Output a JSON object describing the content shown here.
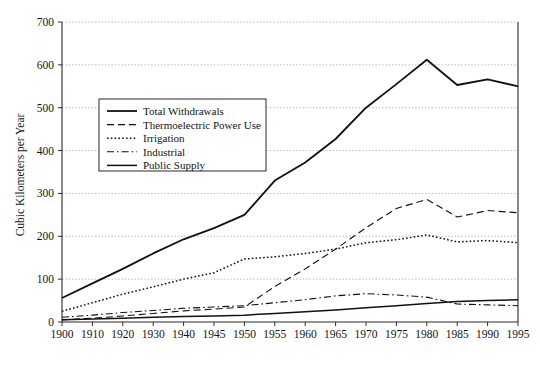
{
  "chart_data": {
    "type": "line",
    "title": "",
    "xlabel": "",
    "ylabel": "Cubic Kilometers per Year",
    "ylim": [
      0,
      700
    ],
    "ytick_step": 100,
    "grid": true,
    "legend_position": "upper-left-inside",
    "categories": [
      "1900",
      "1910",
      "1920",
      "1930",
      "1940",
      "1945",
      "1950",
      "1955",
      "1960",
      "1965",
      "1970",
      "1975",
      "1980",
      "1985",
      "1990",
      "1995"
    ],
    "yticks": [
      "0",
      "100",
      "200",
      "300",
      "400",
      "500",
      "600",
      "700"
    ],
    "series": [
      {
        "name": "Total Withdrawals",
        "style": "solid",
        "width": 1.8,
        "values": [
          56,
          90,
          124,
          160,
          193,
          219,
          250,
          330,
          372,
          427,
          500,
          555,
          612,
          553,
          566,
          550
        ]
      },
      {
        "name": "Thermoelectric Power Use",
        "style": "dashed",
        "width": 1.1,
        "values": [
          5,
          9,
          14,
          20,
          26,
          30,
          35,
          83,
          124,
          170,
          220,
          265,
          286,
          245,
          260,
          255
        ]
      },
      {
        "name": "Irrigation",
        "style": "dotted",
        "width": 1.5,
        "values": [
          25,
          45,
          65,
          82,
          100,
          115,
          147,
          152,
          160,
          170,
          185,
          192,
          203,
          187,
          190,
          185
        ]
      },
      {
        "name": "Industrial",
        "style": "dash-dot",
        "width": 1.1,
        "values": [
          11,
          16,
          22,
          27,
          32,
          35,
          38,
          45,
          52,
          61,
          66,
          63,
          58,
          42,
          40,
          38
        ]
      },
      {
        "name": "Public Supply",
        "style": "solid",
        "width": 1.5,
        "values": [
          5,
          7,
          9,
          11,
          13,
          14,
          16,
          20,
          24,
          28,
          33,
          38,
          43,
          48,
          50,
          52
        ]
      }
    ]
  },
  "legend": {
    "items": [
      {
        "label": "Total Withdrawals",
        "style": "solid"
      },
      {
        "label": "Thermoelectric Power Use",
        "style": "dashed"
      },
      {
        "label": "Irrigation",
        "style": "dotted"
      },
      {
        "label": "Industrial",
        "style": "dash-dot"
      },
      {
        "label": "Public Supply",
        "style": "solid"
      }
    ]
  },
  "axes": {
    "y_axis_title": "Cubic Kilometers per Year"
  }
}
